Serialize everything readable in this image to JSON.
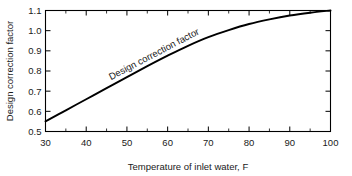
{
  "chart_data": {
    "type": "line",
    "title": "",
    "xlabel": "Temperature of inlet water, F",
    "ylabel": "Design correction factor",
    "xlim": [
      30,
      100
    ],
    "ylim": [
      0.5,
      1.1
    ],
    "grid": false,
    "legend": "none",
    "x_major_ticks": [
      30,
      40,
      50,
      60,
      70,
      80,
      90,
      100
    ],
    "x_major_tick_labels": [
      "30",
      "40",
      "50",
      "60",
      "70",
      "80",
      "90",
      "100"
    ],
    "x_minor_ticks": [
      35,
      45,
      55,
      65,
      75,
      85,
      95
    ],
    "y_major_ticks": [
      0.5,
      0.6,
      0.7,
      0.8,
      0.9,
      1.0,
      1.1
    ],
    "y_major_tick_labels": [
      "0.5",
      "0.6",
      "0.7",
      "0.8",
      "0.9",
      "1.0",
      "1.1"
    ],
    "series": [
      {
        "name": "Design correction factor",
        "annotation": "Design correction factor",
        "x": [
          30,
          35,
          40,
          45,
          50,
          55,
          60,
          65,
          70,
          75,
          80,
          85,
          90,
          95,
          100
        ],
        "values": [
          0.55,
          0.605,
          0.66,
          0.715,
          0.77,
          0.824,
          0.876,
          0.925,
          0.968,
          1.003,
          1.033,
          1.056,
          1.075,
          1.089,
          1.1
        ]
      }
    ]
  },
  "axes": {
    "x_title": "Temperature of inlet water, F",
    "y_title": "Design correction factor"
  },
  "annotations": {
    "curve_label": "Design correction factor"
  }
}
